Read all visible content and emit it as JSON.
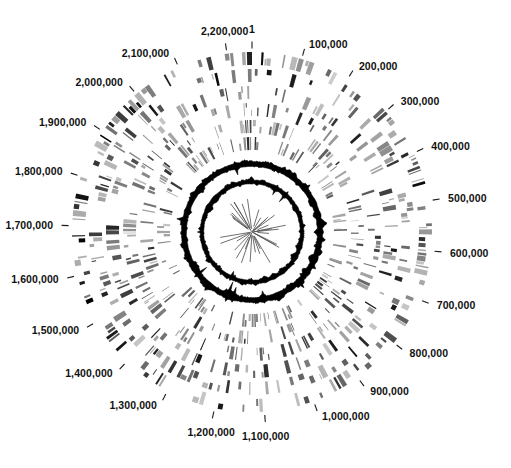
{
  "figure": {
    "kind": "circular-genome-map",
    "background_color": "#ffffff",
    "foreground_color": "#000000",
    "center_x": 252,
    "center_y": 232
  },
  "axis": {
    "name": "genome-coordinate-axis",
    "start_value": 1,
    "end_value": 2250000,
    "units": "bp",
    "tick_interval": 100000,
    "zero_angle_deg": -90,
    "direction": "clockwise",
    "tick_labels": [
      "1",
      "100,000",
      "200,000",
      "300,000",
      "400,000",
      "500,000",
      "600,000",
      "700,000",
      "800,000",
      "900,000",
      "1,000,000",
      "1,100,000",
      "1,200,000",
      "1,300,000",
      "1,400,000",
      "1,500,000",
      "1,600,000",
      "1,700,000",
      "1,800,000",
      "1,900,000",
      "2,000,000",
      "2,100,000",
      "2,200,000"
    ],
    "tick_values": [
      1,
      100000,
      200000,
      300000,
      400000,
      500000,
      600000,
      700000,
      800000,
      900000,
      1000000,
      1100000,
      1200000,
      1300000,
      1400000,
      1500000,
      1600000,
      1700000,
      1800000,
      1900000,
      2000000,
      2100000,
      2200000
    ]
  },
  "chart_data": {
    "type": "circular-genome-map",
    "title": "",
    "subtitle": "",
    "xlabel": "",
    "ylabel": "",
    "grid": false,
    "legend": "none",
    "genome_length_bp": 2250000,
    "outer_radius_px": 180,
    "tick_label_radius_px": 196,
    "rings": [
      {
        "index": 0,
        "name": "forward-cds-ring",
        "radius_outer": 180,
        "radius_inner": 167,
        "color": "#000000",
        "density": 0.52,
        "min_width_deg": 0.32,
        "max_width_deg": 2.0,
        "seed": 101
      },
      {
        "index": 1,
        "name": "reverse-cds-ring",
        "radius_outer": 163,
        "radius_inner": 150,
        "color": "#0b0b0b",
        "density": 0.46,
        "min_width_deg": 0.3,
        "max_width_deg": 2.1,
        "seed": 202
      },
      {
        "index": 2,
        "name": "cog-category-ring-1",
        "radius_outer": 146,
        "radius_inner": 133,
        "color": "#141414",
        "density": 0.44,
        "min_width_deg": 0.3,
        "max_width_deg": 1.9,
        "seed": 303
      },
      {
        "index": 3,
        "name": "cog-category-ring-2",
        "radius_outer": 129,
        "radius_inner": 116,
        "color": "#1c1c1c",
        "density": 0.42,
        "min_width_deg": 0.28,
        "max_width_deg": 1.8,
        "seed": 404
      },
      {
        "index": 4,
        "name": "similarity-ring-1",
        "radius_outer": 112,
        "radius_inner": 99,
        "color": "#262626",
        "density": 0.4,
        "min_width_deg": 0.26,
        "max_width_deg": 1.7,
        "seed": 505
      },
      {
        "index": 5,
        "name": "similarity-ring-2",
        "radius_outer": 95,
        "radius_inner": 82,
        "color": "#2e2e2e",
        "density": 0.38,
        "min_width_deg": 0.26,
        "max_width_deg": 1.6,
        "seed": 606
      }
    ],
    "gc_rings": [
      {
        "index": 0,
        "name": "gc-content-ring",
        "base_radius": 68,
        "band_thickness": 4.5,
        "amplitude": 6.5,
        "color": "#000000",
        "points": 360,
        "seed": 707
      },
      {
        "index": 1,
        "name": "gc-skew-ring",
        "base_radius": 50,
        "band_thickness": 3.2,
        "amplitude": 5.0,
        "color": "#000000",
        "points": 360,
        "seed": 808
      }
    ],
    "inner_spokes": {
      "name": "inner-radial-spokes",
      "count": 34,
      "radius_inner": 6,
      "radius_outer_min": 16,
      "radius_outer_max": 36,
      "color": "#555555",
      "seed": 909
    }
  }
}
